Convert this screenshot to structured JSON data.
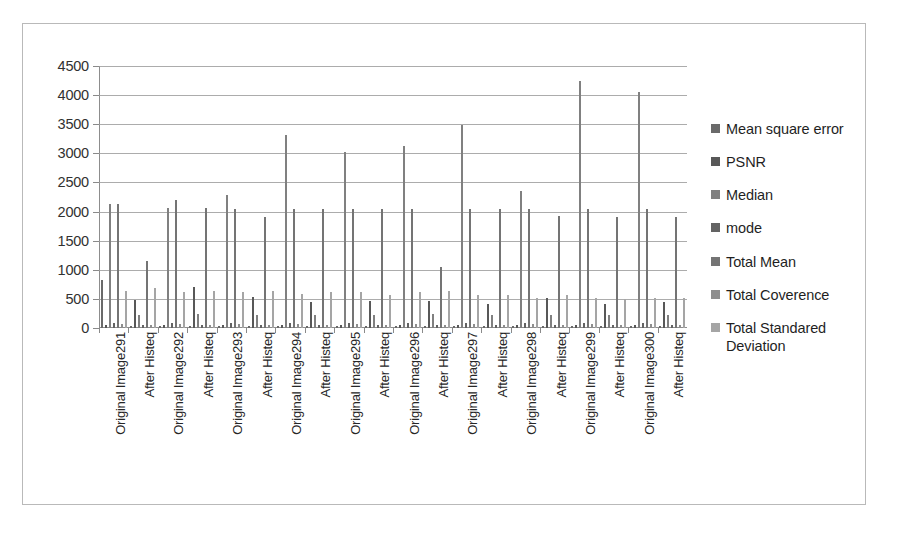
{
  "chart_data": {
    "type": "bar",
    "title": "",
    "xlabel": "",
    "ylabel": "",
    "ylim": [
      0,
      4500
    ],
    "ytick_step": 500,
    "yticks": [
      "4500",
      "4000",
      "3500",
      "3000",
      "2500",
      "2000",
      "1500",
      "1000",
      "500",
      "0"
    ],
    "grid": true,
    "legend_position": "right",
    "categories": [
      "Original Image291",
      "After Histeq",
      "Original Image292",
      "After Histeq",
      "Original Image293",
      "After Histeq",
      "Original Image294",
      "After Histeq",
      "Original Image295",
      "After Histeq",
      "Original Image296",
      "After Histeq",
      "Original Image297",
      "After Histeq",
      "Original Image298",
      "After Histeq",
      "Original Image299",
      "After Histeq",
      "Original Image300",
      "After Histeq"
    ],
    "series": [
      {
        "name": "Mean square error",
        "color": "#6a6a6a",
        "values": [
          820,
          30,
          40,
          30,
          40,
          30,
          40,
          30,
          40,
          30,
          40,
          30,
          40,
          30,
          40,
          30,
          40,
          30,
          40,
          30
        ]
      },
      {
        "name": "PSNR",
        "color": "#585858",
        "values": [
          60,
          480,
          60,
          700,
          60,
          540,
          60,
          450,
          60,
          470,
          60,
          460,
          60,
          420,
          60,
          520,
          60,
          420,
          60,
          450
        ]
      },
      {
        "name": "Median",
        "color": "#808080",
        "values": [
          2130,
          230,
          2060,
          240,
          2290,
          220,
          3320,
          230,
          3020,
          230,
          3120,
          240,
          3480,
          230,
          2360,
          230,
          4250,
          230,
          4050,
          220
        ]
      },
      {
        "name": "mode",
        "color": "#636363",
        "values": [
          80,
          60,
          80,
          60,
          80,
          60,
          80,
          60,
          80,
          60,
          80,
          60,
          80,
          60,
          80,
          60,
          80,
          60,
          80,
          60
        ]
      },
      {
        "name": "Total Mean",
        "color": "#747474",
        "values": [
          2130,
          1150,
          2200,
          2060,
          2050,
          1900,
          2050,
          2050,
          2050,
          2040,
          2050,
          1050,
          2050,
          2040,
          2050,
          1920,
          2050,
          1900,
          2050,
          1900
        ]
      },
      {
        "name": "Total Coverence",
        "color": "#8e8e8e",
        "values": [
          70,
          50,
          70,
          50,
          70,
          50,
          70,
          50,
          70,
          50,
          70,
          50,
          70,
          50,
          70,
          50,
          70,
          50,
          70,
          50
        ]
      },
      {
        "name": "Total Standared Deviation",
        "color": "#a5a5a5",
        "values": [
          630,
          690,
          620,
          630,
          620,
          640,
          580,
          620,
          620,
          560,
          620,
          640,
          560,
          560,
          520,
          560,
          520,
          500,
          520,
          520
        ]
      }
    ]
  },
  "legend": {
    "items": [
      {
        "label": "Mean square error",
        "swatch": "#6a6a6a"
      },
      {
        "label": "PSNR",
        "swatch": "#585858"
      },
      {
        "label": "Median",
        "swatch": "#808080"
      },
      {
        "label": "mode",
        "swatch": "#636363"
      },
      {
        "label": "Total Mean",
        "swatch": "#747474"
      },
      {
        "label": "Total Coverence",
        "swatch": "#8e8e8e"
      },
      {
        "label": "Total Standared Deviation",
        "swatch": "#a5a5a5"
      }
    ]
  }
}
